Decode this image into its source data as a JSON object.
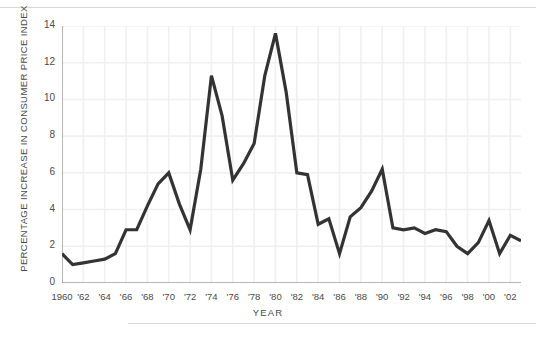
{
  "figure": {
    "ylabel": "PERCENTAGE INCREASE IN CONSUMER PRICE INDEX",
    "xlabel": "YEAR",
    "line_color": "#333333",
    "grid_color": "#f0f0f0",
    "axis_color": "#6e6e6e",
    "rule_color": "#d9d9d9"
  },
  "chart_data": {
    "type": "line",
    "title": "",
    "xlabel": "YEAR",
    "ylabel": "PERCENTAGE INCREASE IN CONSUMER PRICE INDEX",
    "xlim": [
      1960,
      2003
    ],
    "ylim": [
      0,
      14
    ],
    "grid": true,
    "legend": "none",
    "y_ticks": [
      0,
      2,
      4,
      6,
      8,
      10,
      12,
      14
    ],
    "y_tick_labels": [
      "0",
      "2",
      "4",
      "6",
      "8",
      "10",
      "12",
      "14"
    ],
    "y_minor_tick_step": 1,
    "x_ticks": [
      1960,
      1962,
      1964,
      1966,
      1968,
      1970,
      1972,
      1974,
      1976,
      1978,
      1980,
      1982,
      1984,
      1986,
      1988,
      1990,
      1992,
      1994,
      1996,
      1998,
      2000,
      2002
    ],
    "x_tick_labels": [
      "1960",
      "'62",
      "'64",
      "'66",
      "'68",
      "'70",
      "'72",
      "'74",
      "'76",
      "'78",
      "'80",
      "'82",
      "'84",
      "'86",
      "'88",
      "'90",
      "'92",
      "'94",
      "'96",
      "'98",
      "'00",
      "'02"
    ],
    "x_minor_tick_step": 1,
    "x": [
      1960,
      1961,
      1962,
      1963,
      1964,
      1965,
      1966,
      1967,
      1968,
      1969,
      1970,
      1971,
      1972,
      1973,
      1974,
      1975,
      1976,
      1977,
      1978,
      1979,
      1980,
      1981,
      1982,
      1983,
      1984,
      1985,
      1986,
      1987,
      1988,
      1989,
      1990,
      1991,
      1992,
      1993,
      1994,
      1995,
      1996,
      1997,
      1998,
      1999,
      2000,
      2001,
      2002,
      2003
    ],
    "values": [
      1.6,
      1.0,
      1.1,
      1.2,
      1.3,
      1.6,
      2.9,
      2.9,
      4.2,
      5.4,
      6.0,
      4.3,
      2.9,
      6.2,
      11.3,
      9.1,
      5.6,
      6.5,
      7.6,
      11.3,
      13.6,
      10.4,
      6.0,
      5.9,
      3.2,
      3.5,
      1.6,
      3.6,
      4.1,
      5.0,
      6.2,
      3.0,
      2.9,
      3.0,
      2.7,
      2.9,
      2.8,
      2.0,
      1.6,
      2.2,
      3.4,
      1.6,
      2.6,
      2.3
    ],
    "series": [
      {
        "name": "Percentage increase in Consumer Price Index",
        "values": [
          1.6,
          1.0,
          1.1,
          1.2,
          1.3,
          1.6,
          2.9,
          2.9,
          4.2,
          5.4,
          6.0,
          4.3,
          2.9,
          6.2,
          11.3,
          9.1,
          5.6,
          6.5,
          7.6,
          11.3,
          13.6,
          10.4,
          6.0,
          5.9,
          3.2,
          3.5,
          1.6,
          3.6,
          4.1,
          5.0,
          6.2,
          3.0,
          2.9,
          3.0,
          2.7,
          2.9,
          2.8,
          2.0,
          1.6,
          2.2,
          3.4,
          1.6,
          2.6,
          2.3
        ]
      }
    ]
  }
}
